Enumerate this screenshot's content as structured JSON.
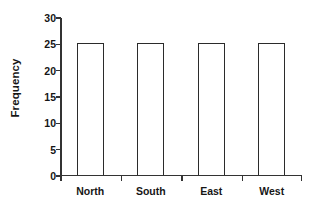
{
  "chart_data": {
    "type": "bar",
    "title": "",
    "subtitle": "",
    "xlabel": "",
    "ylabel": "Frequency",
    "categories": [
      "North",
      "South",
      "East",
      "West"
    ],
    "values": [
      25,
      25,
      25,
      25
    ],
    "series": [
      {
        "name": "Frequency",
        "values": [
          25,
          25,
          25,
          25
        ]
      }
    ],
    "ylim": [
      0,
      30
    ],
    "yticks": [
      0,
      5,
      10,
      15,
      20,
      25,
      30
    ],
    "ytick_labels": [
      "0",
      "5",
      "10",
      "15",
      "20",
      "25",
      "30"
    ],
    "grid": false,
    "legend": false,
    "legend_position": "none",
    "bar_fill_color": "#ffffff",
    "bar_edge_color": "#2b2b2b",
    "axis_color": "#333333",
    "background_color": "#ffffff",
    "text_color": "#161616",
    "annotations": []
  }
}
